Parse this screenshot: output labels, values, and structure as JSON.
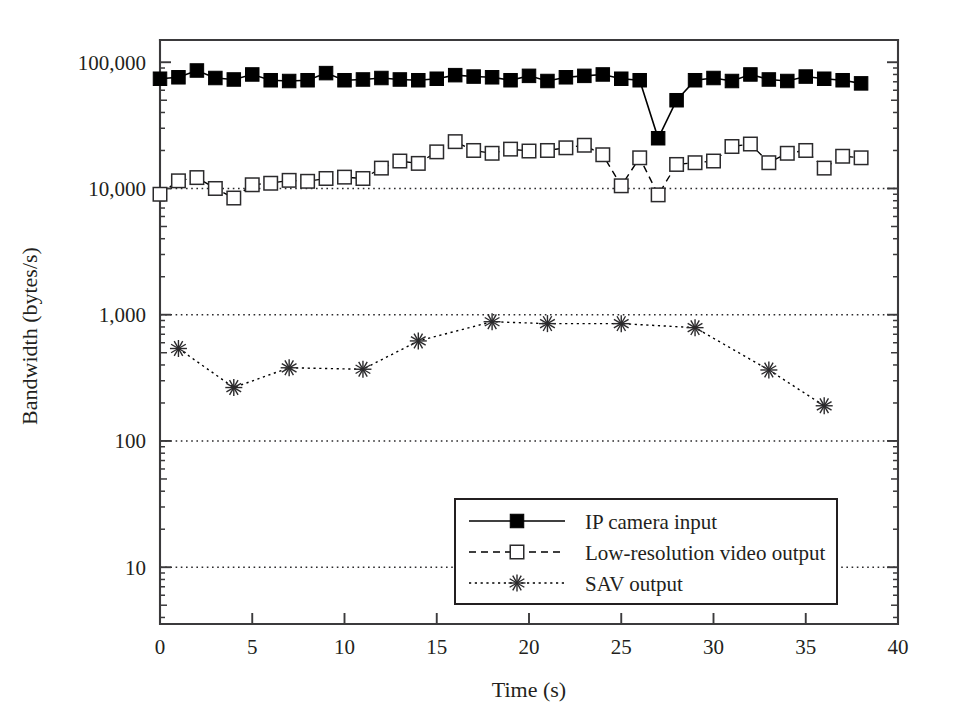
{
  "chart_data": {
    "type": "line",
    "title": "",
    "xlabel": "Time (s)",
    "ylabel": "Bandwidth (bytes/s)",
    "yscale": "log",
    "xlim": [
      0,
      40
    ],
    "ylim": [
      3.5,
      150000
    ],
    "xticks": [
      "0",
      "5",
      "10",
      "15",
      "20",
      "25",
      "30",
      "35",
      "40"
    ],
    "xtick_values": [
      0,
      5,
      10,
      15,
      20,
      25,
      30,
      35,
      40
    ],
    "yticks": [
      "100,000",
      "10,000",
      "1,000",
      "100",
      "10"
    ],
    "ytick_values": [
      100000,
      10000,
      1000,
      100,
      10
    ],
    "grid": "horizontal-dotted-at-decades",
    "legend_position": "lower-right-inside",
    "series": [
      {
        "name": "IP camera input",
        "marker": "filled-square",
        "linestyle": "solid",
        "color": "#000000",
        "x": [
          0,
          1,
          2,
          3,
          4,
          5,
          6,
          7,
          8,
          9,
          10,
          11,
          12,
          13,
          14,
          15,
          16,
          17,
          18,
          19,
          20,
          21,
          22,
          23,
          24,
          25,
          26,
          27,
          28,
          29,
          30,
          31,
          32,
          33,
          34,
          35,
          36,
          37,
          38
        ],
        "values": [
          74000,
          76000,
          86000,
          75000,
          73000,
          80000,
          72000,
          71000,
          72000,
          82000,
          72000,
          73000,
          75000,
          73000,
          72000,
          74000,
          79000,
          77000,
          76000,
          72000,
          78000,
          71000,
          76000,
          78000,
          80000,
          74000,
          72000,
          25000,
          50000,
          72000,
          75000,
          71000,
          80000,
          73000,
          71000,
          77000,
          74000,
          72000,
          68000
        ]
      },
      {
        "name": "Low-resolution video output",
        "marker": "open-square",
        "linestyle": "dashed",
        "color": "#000000",
        "x": [
          0,
          1,
          2,
          3,
          4,
          5,
          6,
          7,
          8,
          9,
          10,
          11,
          12,
          13,
          14,
          15,
          16,
          17,
          18,
          19,
          20,
          21,
          22,
          23,
          24,
          25,
          26,
          27,
          28,
          29,
          30,
          31,
          32,
          33,
          34,
          35,
          36,
          37,
          38
        ],
        "values": [
          9000,
          11500,
          12200,
          10000,
          8400,
          10700,
          11000,
          11600,
          11400,
          12000,
          12300,
          12000,
          14500,
          16500,
          15800,
          19500,
          23500,
          20000,
          19000,
          20500,
          19800,
          20000,
          21000,
          22000,
          18500,
          10500,
          17500,
          8900,
          15500,
          16000,
          16500,
          21500,
          22500,
          16000,
          19000,
          20000,
          14500,
          18000,
          17500
        ]
      },
      {
        "name": "SAV output",
        "marker": "asterisk",
        "linestyle": "dotted",
        "color": "#000000",
        "x": [
          1,
          4,
          7,
          11,
          14,
          18,
          21,
          25,
          29,
          33,
          36
        ],
        "values": [
          540,
          265,
          380,
          370,
          620,
          880,
          850,
          850,
          790,
          365,
          190
        ]
      }
    ]
  }
}
